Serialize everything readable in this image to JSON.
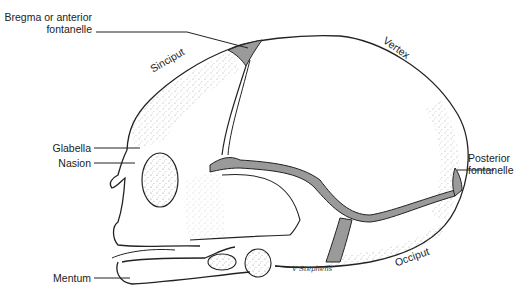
{
  "figure": {
    "labels": {
      "bregma_line1": "Bregma or anterior",
      "bregma_line2": "fontanelle",
      "sinciput": "Sinciput",
      "vertex": "Vertex",
      "glabella": "Glabella",
      "nasion": "Nasion",
      "posterior_line1": "Posterior",
      "posterior_line2": "fontanelle",
      "mentum": "Mentum",
      "occiput": "Occiput"
    },
    "signature": "V Stephens",
    "colors": {
      "outline": "#222222",
      "fontanelle_fill": "#9a9a9a",
      "background": "#ffffff"
    }
  }
}
